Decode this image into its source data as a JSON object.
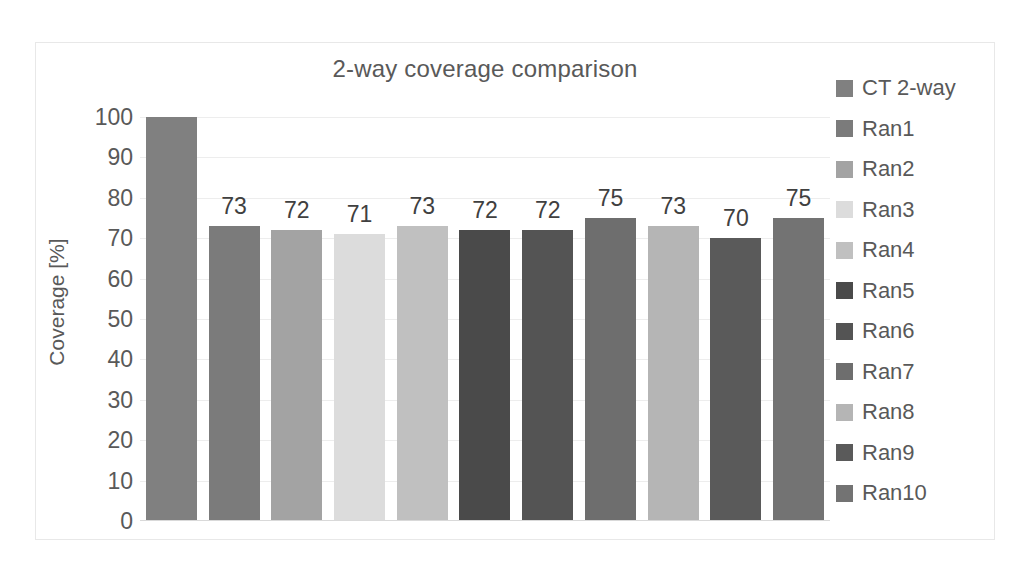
{
  "chart_data": {
    "type": "bar",
    "title": "2-way coverage comparison",
    "xlabel": "",
    "ylabel": "Coverage [%]",
    "ylim": [
      0,
      100
    ],
    "ytick_labels": [
      "100",
      "90",
      "80",
      "70",
      "60",
      "50",
      "40",
      "30",
      "20",
      "10",
      "0"
    ],
    "ytick_values": [
      100,
      90,
      80,
      70,
      60,
      50,
      40,
      30,
      20,
      10,
      0
    ],
    "grid": true,
    "legend_position": "right",
    "categories": [
      "CT 2-way",
      "Ran1",
      "Ran2",
      "Ran3",
      "Ran4",
      "Ran5",
      "Ran6",
      "Ran7",
      "Ran8",
      "Ran9",
      "Ran10"
    ],
    "values": [
      100,
      73,
      72,
      71,
      73,
      72,
      72,
      75,
      73,
      70,
      75
    ],
    "data_labels": [
      "",
      "73",
      "72",
      "71",
      "73",
      "72",
      "72",
      "75",
      "73",
      "70",
      "75"
    ],
    "colors": [
      "#808080",
      "#7b7b7b",
      "#a3a3a3",
      "#dcdcdc",
      "#c0c0c0",
      "#4a4a4a",
      "#545454",
      "#6e6e6e",
      "#b5b5b5",
      "#5a5a5a",
      "#737373"
    ]
  },
  "legend": {
    "items": [
      {
        "label": "CT 2-way",
        "color": "#808080"
      },
      {
        "label": "Ran1",
        "color": "#7b7b7b"
      },
      {
        "label": "Ran2",
        "color": "#a3a3a3"
      },
      {
        "label": "Ran3",
        "color": "#dcdcdc"
      },
      {
        "label": "Ran4",
        "color": "#c0c0c0"
      },
      {
        "label": "Ran5",
        "color": "#4a4a4a"
      },
      {
        "label": "Ran6",
        "color": "#545454"
      },
      {
        "label": "Ran7",
        "color": "#6e6e6e"
      },
      {
        "label": "Ran8",
        "color": "#b5b5b5"
      },
      {
        "label": "Ran9",
        "color": "#5a5a5a"
      },
      {
        "label": "Ran10",
        "color": "#737373"
      }
    ]
  }
}
